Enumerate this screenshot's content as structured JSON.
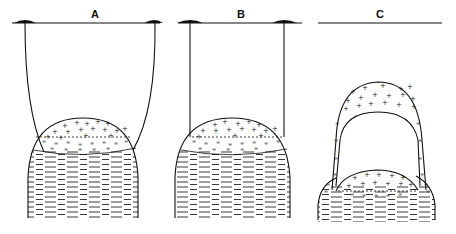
{
  "figure": {
    "panels": [
      {
        "id": "A",
        "label": "A",
        "description": "Dome suspended by curved strings from two surface anchors"
      },
      {
        "id": "B",
        "label": "B",
        "description": "Dome suspended by straight vertical strings from two surface anchors"
      },
      {
        "id": "C",
        "label": "C",
        "description": "Dome cap detached and uplifted, leaving a cavity above a lower dome"
      }
    ],
    "legend_symbols": {
      "cross_pattern": "+",
      "double_dash_pattern": "=",
      "lamination_pattern": "—"
    },
    "colors": {
      "ink": "#111111",
      "background": "#ffffff"
    }
  }
}
